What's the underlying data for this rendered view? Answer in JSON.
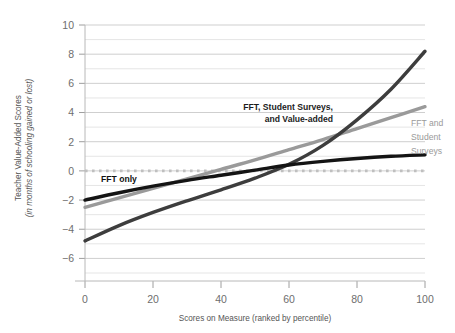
{
  "chart_data": {
    "type": "line",
    "title": "",
    "subtitle": "",
    "xlabel": "Scores on Measure (ranked by percentile)",
    "ylabel_line1": "Teacher Value-Added Scores",
    "ylabel_line2": "(in months of schooling gained or lost)",
    "xlim": [
      0,
      100
    ],
    "ylim": [
      -7,
      10
    ],
    "xticks": [
      "0",
      "20",
      "40",
      "60",
      "80",
      "100"
    ],
    "xtick_values": [
      0,
      20,
      40,
      60,
      80,
      100
    ],
    "yticks": [
      "10",
      "8",
      "6",
      "4",
      "2",
      "0",
      "-2",
      "-4",
      "-6"
    ],
    "ytick_values": [
      10,
      8,
      6,
      4,
      2,
      0,
      -2,
      -4,
      -6
    ],
    "grid": "horizontal gridlines at every integer from -7 to 10",
    "gridline_values": [
      10,
      9,
      8,
      7,
      6,
      5,
      4,
      3,
      2,
      1,
      0,
      -1,
      -2,
      -3,
      -4,
      -5,
      -6,
      -7
    ],
    "legend": "inline annotations on curves",
    "zero_reference_line": {
      "value": 0,
      "style": "dotted",
      "color": "#bfbfbf"
    },
    "x": [
      0,
      10,
      20,
      30,
      40,
      50,
      60,
      70,
      80,
      90,
      100
    ],
    "series": [
      {
        "name": "FFT only",
        "label": "FFT only",
        "color": "#141414",
        "label_color": "#111111",
        "values": [
          -2.0,
          -1.5,
          -1.05,
          -0.65,
          -0.3,
          0.05,
          0.4,
          0.65,
          0.85,
          1.0,
          1.1
        ],
        "shape": "concave increasing"
      },
      {
        "name": "FFT and Student Surveys",
        "label": "FFT and\nStudent\nSurveys",
        "label_lines": [
          "FFT and",
          "Student",
          "Surveys"
        ],
        "color": "#9a9a9a",
        "label_color": "#9a9a9a",
        "values": [
          -2.5,
          -1.85,
          -1.2,
          -0.55,
          0.1,
          0.75,
          1.45,
          2.15,
          2.9,
          3.65,
          4.4
        ],
        "shape": "approximately linear increasing"
      },
      {
        "name": "FFT, Student Surveys, and Value-added",
        "label": "FFT, Student Surveys,\nand Value-added",
        "label_lines": [
          "FFT, Student Surveys,",
          "and Value-added"
        ],
        "color": "#3d3d3d",
        "label_color": "#1d1d1d",
        "values": [
          -4.8,
          -3.75,
          -2.85,
          -2.05,
          -1.3,
          -0.5,
          0.45,
          1.75,
          3.5,
          5.6,
          8.2
        ],
        "shape": "convex increasing"
      }
    ]
  }
}
